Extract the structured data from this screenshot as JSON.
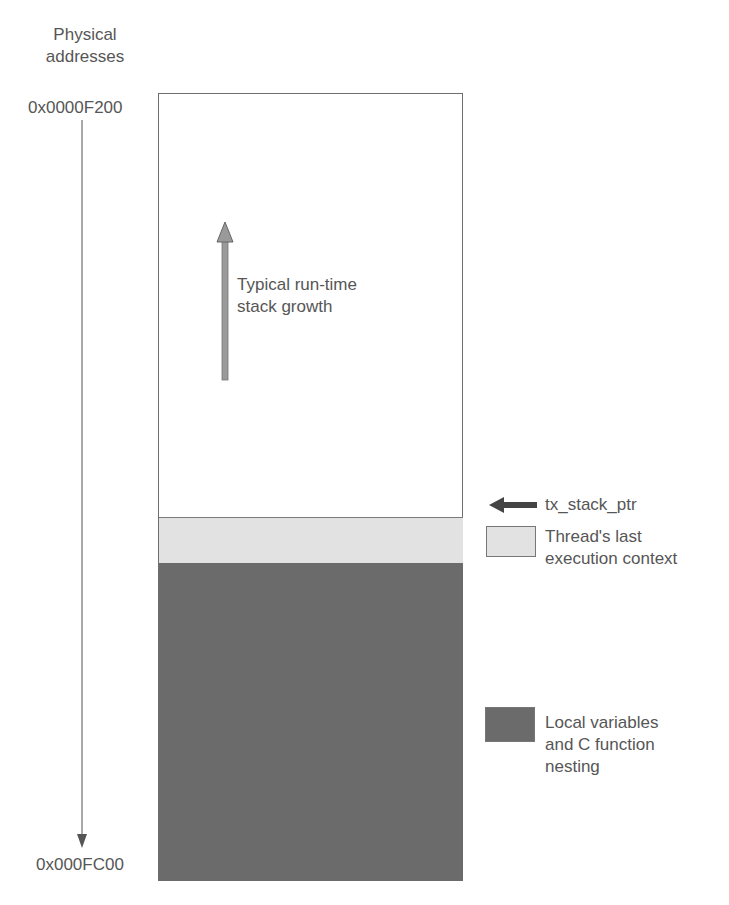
{
  "axis": {
    "title_line1": "Physical",
    "title_line2": "addresses",
    "top_address": "0x0000F200",
    "bottom_address": "0x000FC00"
  },
  "stack": {
    "growth_label_line1": "Typical run-time",
    "growth_label_line2": "stack growth",
    "pointer_label": "tx_stack_ptr"
  },
  "legend": {
    "items": [
      {
        "lines": [
          "Thread's last",
          "execution context"
        ],
        "color": "#e2e2e2"
      },
      {
        "lines": [
          "Local variables",
          "and C function",
          "nesting"
        ],
        "color": "#6b6b6b"
      }
    ]
  },
  "colors": {
    "outline": "#6e6e6e",
    "context_fill": "#e2e2e2",
    "locals_fill": "#6b6b6b",
    "growth_arrow": "#9a9a9a",
    "pointer_arrow": "#444444"
  }
}
